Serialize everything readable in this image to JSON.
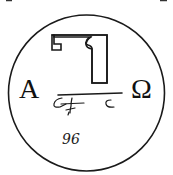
{
  "emblem": {
    "left_letter": "A",
    "right_letter": "Ω",
    "bottom_mark": "96",
    "colors": {
      "ink": "#1a1a1a",
      "background": "#ffffff"
    }
  }
}
